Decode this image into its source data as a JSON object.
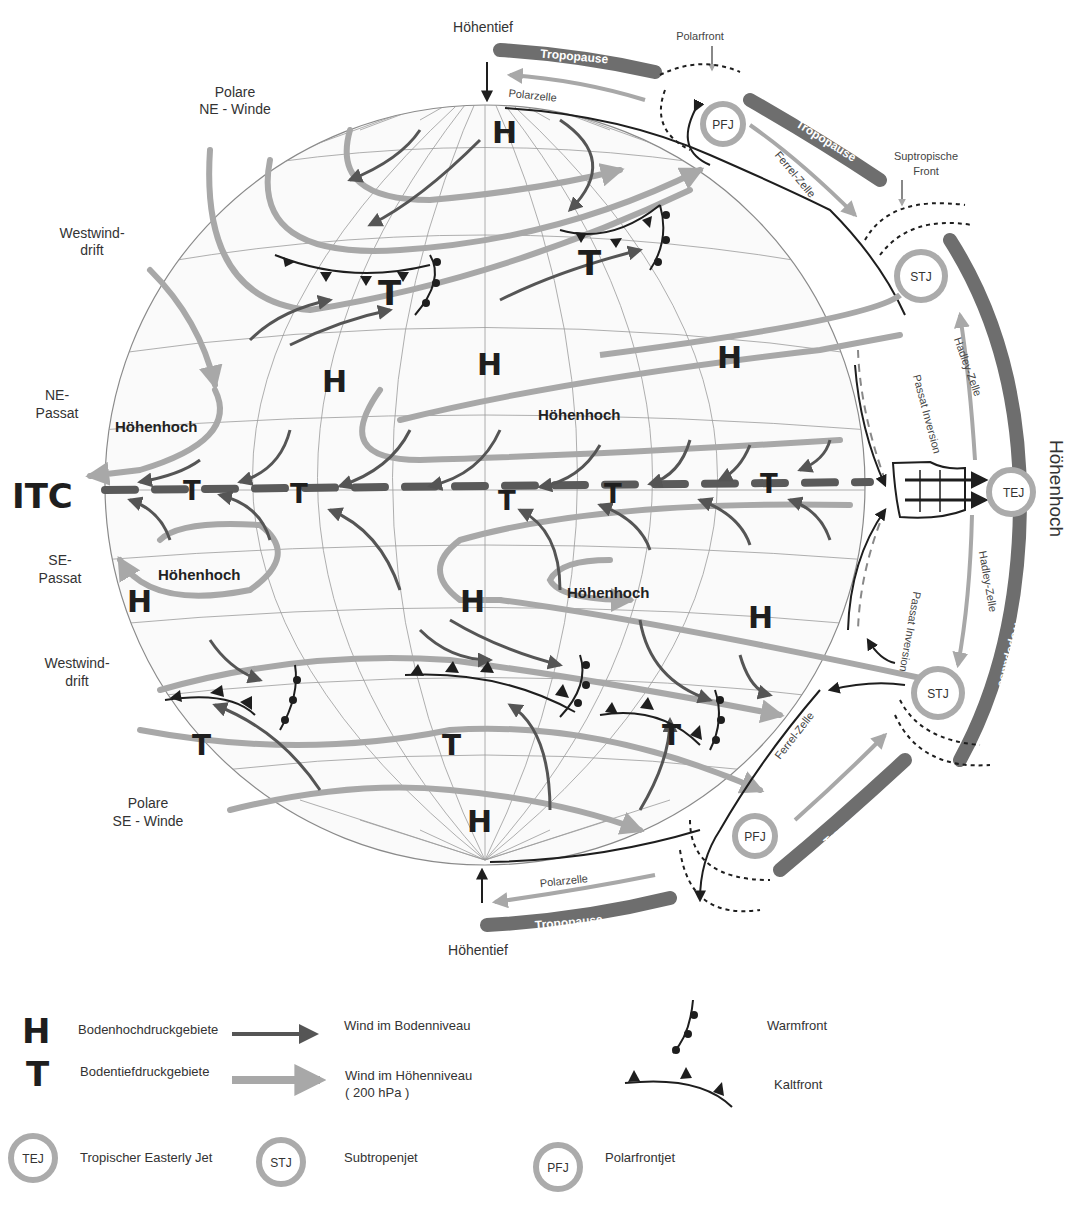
{
  "colors": {
    "surface_wind": "#555555",
    "upper_wind": "#a8a8a8",
    "tropopause": "#6e6e6e",
    "jet_ring": "#ababab",
    "itc_dash": "#5a5a5a",
    "grid": "#8a8a8a",
    "ink": "#1e1e1e"
  },
  "labels": {
    "top_hoehentief": "Höhentief",
    "bottom_hoehentief": "Höhentief",
    "polarfront_top": "Polarfront",
    "suptropische_front_line1": "Suptropische",
    "suptropische_front_line2": "Front",
    "hoehenhoch_right": "Höhenhoch",
    "polarzelle_top": "Polarzelle",
    "polarzelle_bottom": "Polarzelle",
    "ferrel_top": "Ferrel-Zelle",
    "ferrel_bottom": "Ferrel-Zelle",
    "hadley_top": "Hadley-Zelle",
    "hadley_bottom": "Hadley-Zelle",
    "passat_inversion_top": "Passat Inversion",
    "passat_inversion_bottom": "Passat Inversion",
    "tropopause": "Tropopause",
    "itc": "ITC"
  },
  "left_labels": {
    "polare_ne_1": "Polare",
    "polare_ne_2": "NE - Winde",
    "westwind_n_1": "Westwind-",
    "westwind_n_2": "drift",
    "ne_passat_1": "NE-",
    "ne_passat_2": "Passat",
    "se_passat_1": "SE-",
    "se_passat_2": "Passat",
    "westwind_s_1": "Westwind-",
    "westwind_s_2": "drift",
    "polare_se_1": "Polare",
    "polare_se_2": "SE - Winde"
  },
  "globe": {
    "pressure_high": "H",
    "pressure_low": "T",
    "hoehenhoch_labels": [
      "Höhenhoch",
      "Höhenhoch",
      "Höhenhoch",
      "Höhenhoch"
    ]
  },
  "jets": {
    "pfj": "PFJ",
    "stj": "STJ",
    "tej": "TEJ"
  },
  "legend": {
    "h_symbol": "H",
    "h_label": "Bodenhochdruckgebiete",
    "t_symbol": "T",
    "t_label": "Bodentiefdruckgebiete",
    "surface_wind_label": "Wind im Bodenniveau",
    "upper_wind_label_1": "Wind im Höhenniveau",
    "upper_wind_label_2": "( 200 hPa )",
    "warmfront_label": "Warmfront",
    "kaltfront_label": "Kaltfront",
    "tej_symbol": "TEJ",
    "tej_label": "Tropischer Easterly Jet",
    "stj_symbol": "STJ",
    "stj_label": "Subtropenjet",
    "pfj_symbol": "PFJ",
    "pfj_label": "Polarfrontjet"
  }
}
